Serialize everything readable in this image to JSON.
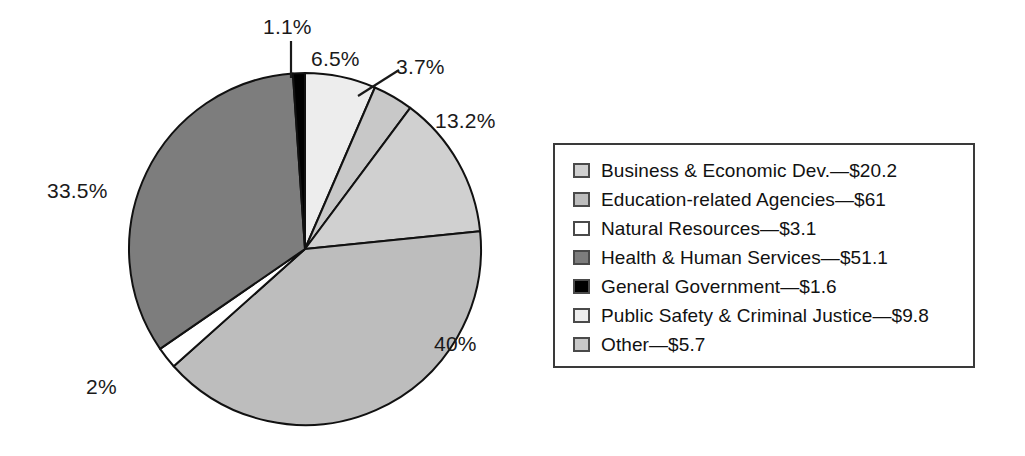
{
  "chart_data": {
    "type": "pie",
    "title": "",
    "subtitle": "",
    "xlabel": "",
    "ylabel": "",
    "legend_position": "right",
    "grid": false,
    "units": "billions of dollars",
    "start_angle_deg": 0,
    "direction": "clockwise",
    "categories": [
      "Business & Economic Dev.",
      "Education-related Agencies",
      "Natural Resources",
      "Health & Human Services",
      "General Government",
      "Public Safety & Criminal Justice",
      "Other"
    ],
    "values": [
      20.2,
      61,
      3.1,
      51.1,
      1.6,
      9.8,
      5.7
    ],
    "percent_labels": [
      "13.2%",
      "40%",
      "2%",
      "33.5%",
      "1.1%",
      "6.5%",
      "3.7%"
    ],
    "percents": [
      13.2,
      40,
      2,
      33.5,
      1.1,
      6.5,
      3.7
    ],
    "colors": [
      "#d0d0d0",
      "#bdbdbd",
      "#ffffff",
      "#7d7d7d",
      "#000000",
      "#ededed",
      "#c8c8c8"
    ],
    "slices": [
      {
        "name": "Public Safety & Criminal Justice",
        "value": 9.8,
        "percent": 6.5,
        "percent_label": "6.5%",
        "color": "#ededed",
        "order_clockwise": 1
      },
      {
        "name": "Other",
        "value": 5.7,
        "percent": 3.7,
        "percent_label": "3.7%",
        "color": "#c8c8c8",
        "order_clockwise": 2
      },
      {
        "name": "Business & Economic Dev.",
        "value": 20.2,
        "percent": 13.2,
        "percent_label": "13.2%",
        "color": "#d0d0d0",
        "order_clockwise": 3
      },
      {
        "name": "Education-related Agencies",
        "value": 61,
        "percent": 40,
        "percent_label": "40%",
        "color": "#bdbdbd",
        "order_clockwise": 4
      },
      {
        "name": "Natural Resources",
        "value": 3.1,
        "percent": 2,
        "percent_label": "2%",
        "color": "#ffffff",
        "order_clockwise": 5
      },
      {
        "name": "Health & Human Services",
        "value": 51.1,
        "percent": 33.5,
        "percent_label": "33.5%",
        "color": "#7d7d7d",
        "order_clockwise": 6
      },
      {
        "name": "General Government",
        "value": 1.6,
        "percent": 1.1,
        "percent_label": "1.1%",
        "color": "#000000",
        "order_clockwise": 7
      }
    ]
  },
  "pie": {
    "labels": {
      "general_government": "1.1%",
      "public_safety": "6.5%",
      "other": "3.7%",
      "business_economic_dev": "13.2%",
      "education": "40%",
      "natural_resources": "2%",
      "health_human_services": "33.5%"
    }
  },
  "legend": {
    "entries": [
      {
        "label": "Business & Economic Dev.—$20.2",
        "color": "#d0d0d0"
      },
      {
        "label": "Education-related Agencies—$61",
        "color": "#bdbdbd"
      },
      {
        "label": "Natural Resources—$3.1",
        "color": "#ffffff"
      },
      {
        "label": "Health & Human Services—$51.1",
        "color": "#7d7d7d"
      },
      {
        "label": "General Government—$1.6",
        "color": "#000000"
      },
      {
        "label": "Public Safety & Criminal Justice—$9.8",
        "color": "#ededed"
      },
      {
        "label": "Other—$5.7",
        "color": "#c8c8c8"
      }
    ]
  }
}
